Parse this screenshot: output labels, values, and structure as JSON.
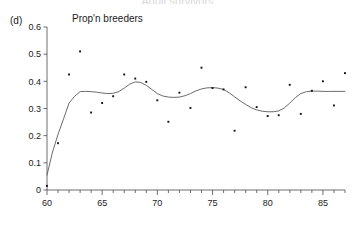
{
  "figure": {
    "title": "Adult survivors",
    "panel_label": "(d)"
  },
  "chart_data": {
    "type": "scatter",
    "title": "Adult survivors",
    "panel_label": "(d)",
    "xlabel": "",
    "ylabel": "Prop'n breeders",
    "ylabel_position": "top-left",
    "xlim": [
      60,
      87
    ],
    "ylim": [
      0,
      0.6
    ],
    "grid": false,
    "legend": false,
    "x_ticks_major": [
      60,
      65,
      70,
      75,
      80,
      85
    ],
    "x_tick_labels": [
      "60",
      "65",
      "70",
      "75",
      "80",
      "85"
    ],
    "x_ticks_minor": [
      61,
      62,
      63,
      64,
      66,
      67,
      68,
      69,
      71,
      72,
      73,
      74,
      76,
      77,
      78,
      79,
      81,
      82,
      83,
      84,
      86,
      87
    ],
    "y_ticks": [
      0,
      0.1,
      0.2,
      0.3,
      0.4,
      0.5,
      0.6
    ],
    "y_tick_labels": [
      "0",
      "0.1",
      "0.2",
      "0.3",
      "0.4",
      "0.5",
      "0.6"
    ],
    "x": [
      60,
      61,
      62,
      63,
      64,
      65,
      66,
      67,
      68,
      69,
      70,
      71,
      72,
      73,
      74,
      75,
      76,
      77,
      78,
      79,
      80,
      81,
      82,
      83,
      84,
      85,
      86,
      87
    ],
    "values": [
      0.015,
      0.172,
      0.425,
      0.51,
      0.285,
      0.32,
      0.345,
      0.425,
      0.41,
      0.398,
      0.33,
      0.251,
      0.358,
      0.302,
      0.45,
      0.375,
      0.37,
      0.218,
      0.378,
      0.305,
      0.272,
      0.275,
      0.387,
      0.28,
      0.365,
      0.4,
      0.311,
      0.43
    ],
    "series": [
      {
        "name": "Prop'n breeders (observed)",
        "marker": "point",
        "color": "#111111",
        "x": [
          60,
          61,
          62,
          63,
          64,
          65,
          66,
          67,
          68,
          69,
          70,
          71,
          72,
          73,
          74,
          75,
          76,
          77,
          78,
          79,
          80,
          81,
          82,
          83,
          84,
          85,
          86,
          87
        ],
        "values": [
          0.015,
          0.172,
          0.425,
          0.51,
          0.285,
          0.32,
          0.345,
          0.425,
          0.41,
          0.398,
          0.33,
          0.251,
          0.358,
          0.302,
          0.45,
          0.375,
          0.37,
          0.218,
          0.378,
          0.305,
          0.272,
          0.275,
          0.387,
          0.28,
          0.365,
          0.4,
          0.311,
          0.43
        ]
      },
      {
        "name": "Smoothed fit",
        "marker": "none",
        "line": "solid",
        "color": "#5a5a5a",
        "x": [
          60,
          60.5,
          61,
          61.5,
          62,
          62.5,
          63,
          63.5,
          64,
          64.5,
          65,
          65.5,
          66,
          66.5,
          67,
          67.5,
          68,
          68.5,
          69,
          69.5,
          70,
          70.5,
          71,
          71.5,
          72,
          72.5,
          73,
          73.5,
          74,
          74.5,
          75,
          75.5,
          76,
          76.5,
          77,
          77.5,
          78,
          78.5,
          79,
          79.5,
          80,
          80.5,
          81,
          81.5,
          82,
          82.5,
          83,
          83.5,
          84,
          84.5,
          85,
          85.5,
          86,
          86.5,
          87
        ],
        "values": [
          0.055,
          0.14,
          0.205,
          0.262,
          0.32,
          0.345,
          0.362,
          0.363,
          0.362,
          0.36,
          0.357,
          0.355,
          0.356,
          0.362,
          0.375,
          0.39,
          0.398,
          0.396,
          0.385,
          0.37,
          0.355,
          0.346,
          0.342,
          0.341,
          0.342,
          0.347,
          0.355,
          0.365,
          0.372,
          0.376,
          0.377,
          0.375,
          0.37,
          0.358,
          0.343,
          0.328,
          0.315,
          0.303,
          0.295,
          0.29,
          0.288,
          0.288,
          0.291,
          0.302,
          0.32,
          0.34,
          0.355,
          0.362,
          0.364,
          0.364,
          0.363,
          0.363,
          0.363,
          0.363,
          0.363
        ]
      }
    ]
  }
}
